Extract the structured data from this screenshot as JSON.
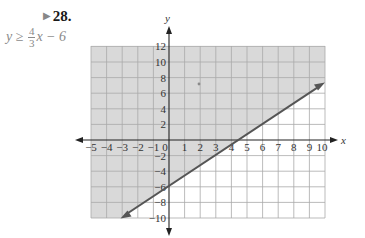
{
  "problem": {
    "number": "28.",
    "marker_icon": "play-triangle-icon",
    "inequality": {
      "lhs": "y ≥",
      "frac_num": "4",
      "frac_den": "3",
      "rhs": "x − 6"
    }
  },
  "graph": {
    "x_axis_label": "x",
    "y_axis_label": "y",
    "x_ticks": [
      "−5",
      "−4",
      "−3",
      "−2",
      "−1",
      "0",
      "1",
      "2",
      "3",
      "4",
      "5",
      "6",
      "7",
      "8",
      "9",
      "10"
    ],
    "y_ticks": [
      "12",
      "10",
      "8",
      "6",
      "4",
      "2",
      "−2",
      "−4",
      "−6",
      "−8",
      "−10"
    ],
    "xlim": [
      -5,
      10
    ],
    "ylim": [
      -10,
      12
    ],
    "boundary_line": "y = (4/3)x − 6",
    "boundary_style": "solid",
    "shaded_region": "above line",
    "colors": {
      "shade": "#d9d9d9",
      "grid": "#a9a9a9",
      "line": "#555555",
      "axis": "#222222"
    }
  }
}
